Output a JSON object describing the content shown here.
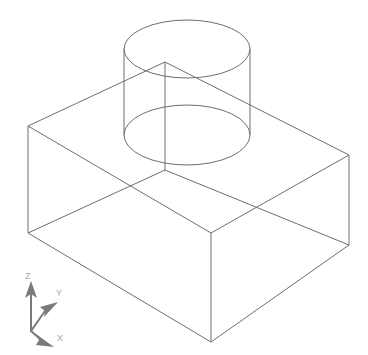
{
  "figure": {
    "background_color": "#ffffff",
    "line_color": "#6e6e6e",
    "line_width": 1,
    "axis_color": "#7a7a7a",
    "axis_label_color": "#a8a8a8",
    "projection": "isometric",
    "render_style": "wireframe"
  },
  "geometry": {
    "box": {
      "name": "rectangular-block",
      "vertices": {
        "top_left": {
          "x": 28,
          "y": 126
        },
        "top_back": {
          "x": 165,
          "y": 62
        },
        "top_right": {
          "x": 349,
          "y": 155
        },
        "top_front": {
          "x": 211,
          "y": 233
        },
        "bot_left": {
          "x": 28,
          "y": 233
        },
        "bot_back": {
          "x": 165,
          "y": 170
        },
        "bot_right": {
          "x": 349,
          "y": 245
        },
        "bot_front": {
          "x": 211,
          "y": 342
        }
      },
      "top_face_path": "M28,126 L165,62 L349,155 L211,233 Z",
      "bottom_face_path": "M28,233 L165,170 L349,245 L211,342 Z",
      "vertical_edges": [
        {
          "x1": 28,
          "y1": 126,
          "x2": 28,
          "y2": 233
        },
        {
          "x1": 165,
          "y1": 62,
          "x2": 165,
          "y2": 170
        },
        {
          "x1": 349,
          "y1": 155,
          "x2": 349,
          "y2": 245
        },
        {
          "x1": 211,
          "y1": 233,
          "x2": 211,
          "y2": 342
        }
      ]
    },
    "cylinder": {
      "name": "cylindrical-boss",
      "top_ellipse": {
        "cx": 187,
        "cy": 49,
        "rx": 63,
        "ry": 29
      },
      "bottom_ellipse": {
        "cx": 187,
        "cy": 135,
        "rx": 63,
        "ry": 30
      },
      "silhouette_lines": [
        {
          "x1": 124,
          "y1": 49,
          "x2": 124,
          "y2": 135
        },
        {
          "x1": 250,
          "y1": 49,
          "x2": 250,
          "y2": 135
        }
      ],
      "height": 86
    }
  },
  "axis_indicator": {
    "name": "coordinate-axis-tripod",
    "origin": {
      "x": 31,
      "y": 331
    },
    "axes": [
      {
        "label": "Z",
        "tip": {
          "x": 31,
          "y": 283
        },
        "label_pos": {
          "x": 25,
          "y": 279
        }
      },
      {
        "label": "Y",
        "tip": {
          "x": 57,
          "y": 303
        },
        "label_pos": {
          "x": 56,
          "y": 296
        }
      },
      {
        "label": "X",
        "tip": {
          "x": 52,
          "y": 345
        },
        "label_pos": {
          "x": 57,
          "y": 341
        }
      }
    ]
  }
}
